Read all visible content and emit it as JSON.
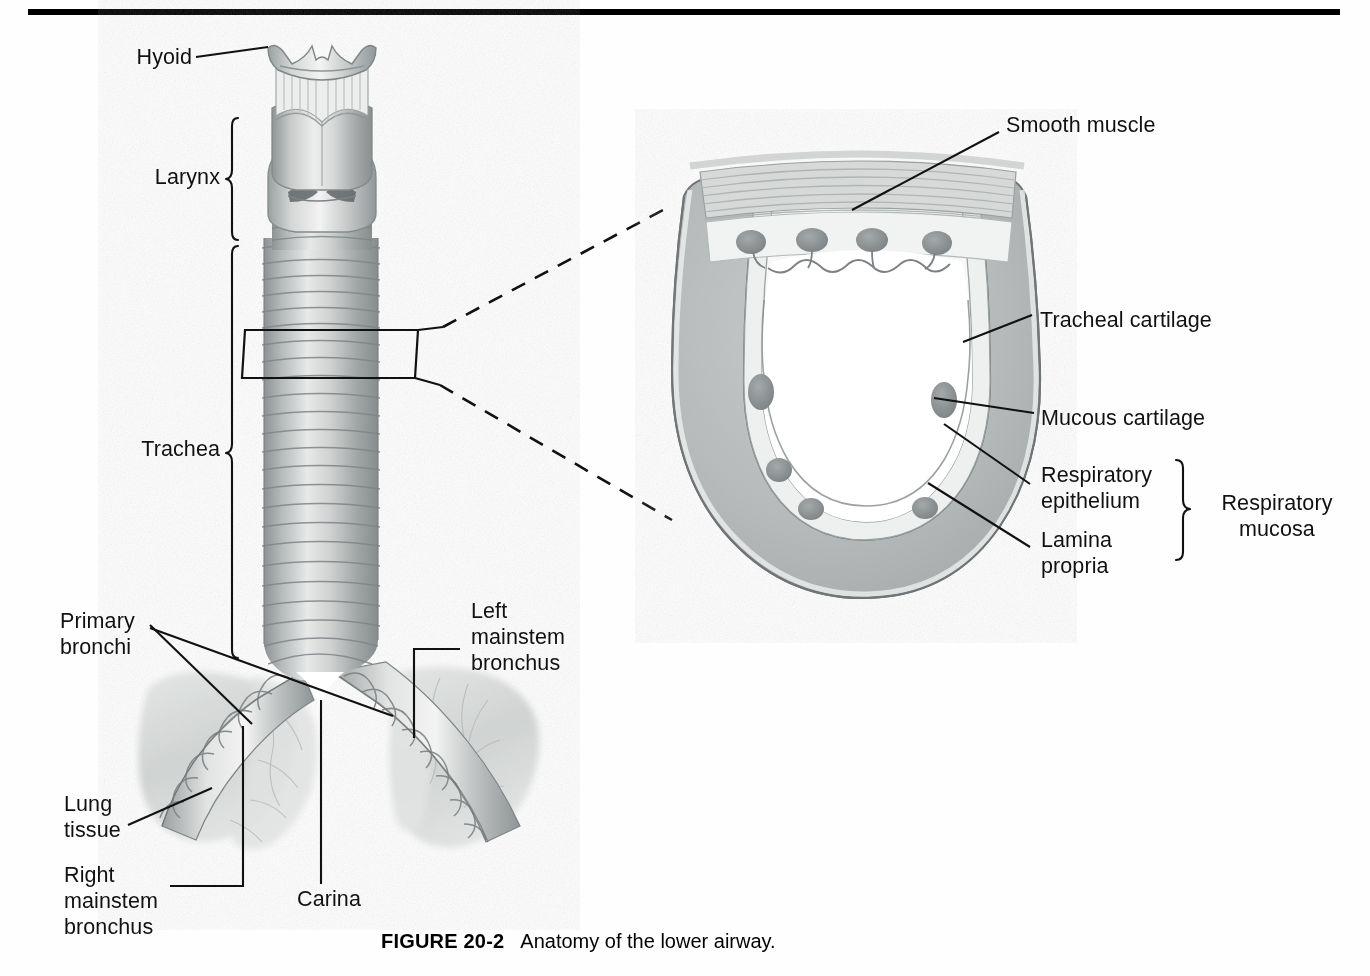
{
  "figure": {
    "number": "FIGURE 20-2",
    "caption": "Anatomy of the lower airway.",
    "top_rule_color": "#000000",
    "background_color": "#fefefe"
  },
  "left_diagram": {
    "name": "lower-airway-longitudinal-view",
    "labels": {
      "hyoid": "Hyoid",
      "larynx": "Larynx",
      "trachea": "Trachea",
      "primary_bronchi_line1": "Primary",
      "primary_bronchi_line2": "bronchi",
      "left_mainstem_line1": "Left",
      "left_mainstem_line2": "mainstem",
      "left_mainstem_line3": "bronchus",
      "lung_tissue_line1": "Lung",
      "lung_tissue_line2": "tissue",
      "right_mainstem_line1": "Right",
      "right_mainstem_line2": "mainstem",
      "right_mainstem_line3": "bronchus",
      "carina": "Carina"
    }
  },
  "right_diagram": {
    "name": "tracheal-cross-section",
    "labels": {
      "smooth_muscle": "Smooth muscle",
      "tracheal_cartilage": "Tracheal cartilage",
      "mucous_cartilage": "Mucous cartilage",
      "respiratory_epithelium_line1": "Respiratory",
      "respiratory_epithelium_line2": "epithelium",
      "lamina_propria_line1": "Lamina",
      "lamina_propria_line2": "propria",
      "respiratory_mucosa_line1": "Respiratory",
      "respiratory_mucosa_line2": "mucosa"
    }
  },
  "palette": {
    "ink": "#111111",
    "cartilage_gray": "#b9bcbd",
    "cartilage_gray_dark": "#a7abac",
    "mucosa_light": "#e9eceb",
    "lumen_white": "#ffffff",
    "gland_gray": "#8e9294",
    "tissue_mid": "#c2c5c4",
    "tissue_dark": "#9a9e9f",
    "lung_pale": "#d8dbda"
  }
}
